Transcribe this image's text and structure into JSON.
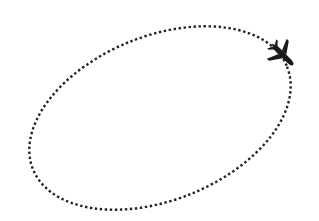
{
  "illustration": {
    "description": "Dotted elliptical flight path with airplane icon",
    "path_style": "dotted",
    "path_color": "#222222",
    "icon": "airplane-icon",
    "icon_color": "#1a1a1a",
    "background": "#ffffff"
  }
}
